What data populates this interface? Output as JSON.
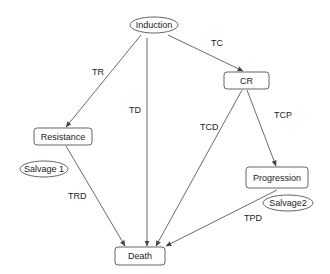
{
  "diagram": {
    "type": "state-transition",
    "colors": {
      "stroke": "#555555",
      "text": "#222222",
      "background": "#ffffff"
    },
    "nodes": [
      {
        "id": "induction",
        "label": "Induction",
        "shape": "ellipse",
        "cx": 154,
        "cy": 25,
        "rx": 24,
        "ry": 8
      },
      {
        "id": "cr",
        "label": "CR",
        "shape": "rounded-rect",
        "x": 224,
        "y": 72,
        "w": 45,
        "h": 17
      },
      {
        "id": "resistance",
        "label": "Resistance",
        "shape": "rounded-rect",
        "x": 34,
        "y": 128,
        "w": 58,
        "h": 17
      },
      {
        "id": "salvage1",
        "label": "Salvage 1",
        "shape": "ellipse",
        "cx": 44,
        "cy": 169,
        "rx": 24,
        "ry": 8
      },
      {
        "id": "progression",
        "label": "Progression",
        "shape": "rounded-rect",
        "x": 246,
        "y": 167,
        "w": 62,
        "h": 21
      },
      {
        "id": "salvage2",
        "label": "Salvage2",
        "shape": "ellipse",
        "cx": 288,
        "cy": 203,
        "rx": 25,
        "ry": 8
      },
      {
        "id": "death",
        "label": "Death",
        "shape": "rounded-rect",
        "x": 115,
        "y": 247,
        "w": 50,
        "h": 18
      }
    ],
    "edges": [
      {
        "id": "tr",
        "label": "TR",
        "from": "induction",
        "to": "resistance",
        "x1": 141,
        "y1": 35,
        "x2": 66,
        "y2": 127,
        "lx": 92,
        "ly": 75
      },
      {
        "id": "td",
        "label": "TD",
        "from": "induction",
        "to": "death",
        "x1": 147,
        "y1": 38,
        "x2": 147,
        "y2": 246,
        "lx": 129,
        "ly": 113
      },
      {
        "id": "tc",
        "label": "TC",
        "from": "induction",
        "to": "cr",
        "x1": 168,
        "y1": 35,
        "x2": 243,
        "y2": 71,
        "lx": 211,
        "ly": 46
      },
      {
        "id": "tcd",
        "label": "TCD",
        "from": "cr",
        "to": "death",
        "x1": 242,
        "y1": 90,
        "x2": 156,
        "y2": 246,
        "lx": 200,
        "ly": 130
      },
      {
        "id": "tcp",
        "label": "TCP",
        "from": "cr",
        "to": "progression",
        "x1": 247,
        "y1": 90,
        "x2": 276,
        "y2": 166,
        "lx": 274,
        "ly": 118
      },
      {
        "id": "trd",
        "label": "TRD",
        "from": "resistance",
        "to": "death",
        "x1": 66,
        "y1": 146,
        "x2": 125,
        "y2": 246,
        "lx": 68,
        "ly": 199
      },
      {
        "id": "tpd",
        "label": "TPD",
        "from": "progression",
        "to": "death",
        "x1": 277,
        "y1": 190,
        "x2": 166,
        "y2": 246,
        "lx": 244,
        "ly": 221
      }
    ]
  }
}
